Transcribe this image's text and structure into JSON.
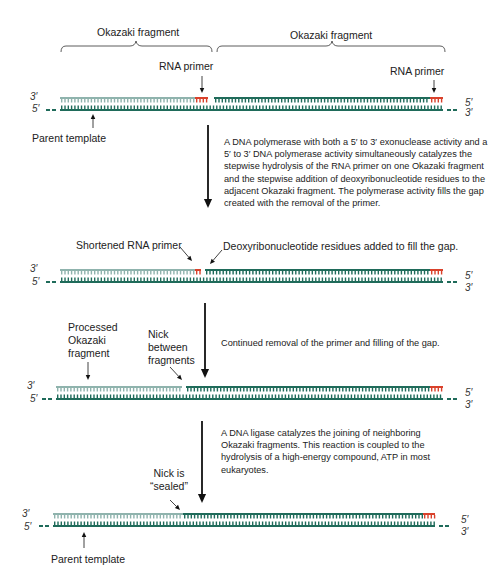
{
  "colors": {
    "new_dna": "#1f6b5a",
    "old_fragment": "#8fb3ad",
    "rna_primer": "#d9412b",
    "template": "#1f6b5a",
    "arrow": "#111111"
  },
  "step1": {
    "fragment_left_label": "Okazaki fragment",
    "fragment_right_label": "Okazaki fragment",
    "primer_left_label": "RNA primer",
    "primer_right_label": "RNA primer",
    "parent_template_label": "Parent template",
    "end_top_left": "3′",
    "end_bottom_left": "5′",
    "end_top_right": "5′",
    "end_bottom_right": "3′"
  },
  "arrow1_text": "A DNA polymerase with both a 5′ to 3′ exonuclease activity and a 5′ to 3′ DNA polymerase activity simultaneously catalyzes the stepwise hydrolysis of the RNA primer on one Okazaki fragment and the stepwise addition of deoxyribonucleotide residues to the adjacent Okazaki fragment. The polymerase activity fills the gap created with the removal of the primer.",
  "step2": {
    "shortened_primer_label": "Shortened RNA primer",
    "residues_added_label": "Deoxyribonucleotide residues added to fill the gap.",
    "end_top_left": "3′",
    "end_bottom_left": "5′",
    "end_top_right": "5′",
    "end_bottom_right": "3′"
  },
  "arrow2_text": "Continued removal of the primer and filling of the gap.",
  "step3": {
    "processed_label": [
      "Processed",
      "Okazaki",
      "fragment"
    ],
    "nick_label": [
      "Nick",
      "between",
      "fragments"
    ],
    "end_top_left": "3′",
    "end_bottom_left": "5′",
    "end_top_right": "5′",
    "end_bottom_right": "3′"
  },
  "arrow3_text": "A DNA ligase catalyzes the joining of neighboring Okazaki fragments. This reaction is coupled to the hydrolysis of a high-energy compound, ATP in most eukaryotes.",
  "step4": {
    "sealed_label": [
      "Nick is",
      "“sealed”"
    ],
    "parent_template_label": "Parent template",
    "end_top_left": "3′",
    "end_bottom_left": "5′",
    "end_top_right": "5′",
    "end_bottom_right": "3′"
  },
  "strands": [
    {
      "y": 97,
      "segments": [
        {
          "x1": 60,
          "x2": 195,
          "c": "old"
        },
        {
          "x1": 195,
          "x2": 208,
          "c": "rna"
        },
        {
          "x1": 214,
          "x2": 430,
          "c": "new"
        },
        {
          "x1": 430,
          "x2": 443,
          "c": "rna"
        }
      ]
    },
    {
      "y": 269,
      "segments": [
        {
          "x1": 60,
          "x2": 195,
          "c": "old"
        },
        {
          "x1": 195,
          "x2": 201,
          "c": "rna"
        },
        {
          "x1": 205,
          "x2": 430,
          "c": "new"
        },
        {
          "x1": 430,
          "x2": 443,
          "c": "rna"
        }
      ]
    },
    {
      "y": 386,
      "segments": [
        {
          "x1": 56,
          "x2": 182,
          "c": "old"
        },
        {
          "x1": 186,
          "x2": 430,
          "c": "new"
        },
        {
          "x1": 430,
          "x2": 443,
          "c": "rna"
        }
      ]
    },
    {
      "y": 513,
      "segments": [
        {
          "x1": 53,
          "x2": 183,
          "c": "old"
        },
        {
          "x1": 183,
          "x2": 423,
          "c": "new"
        },
        {
          "x1": 423,
          "x2": 435,
          "c": "rna"
        }
      ]
    }
  ],
  "templates": [
    {
      "y": 109,
      "x1": 60,
      "x2": 443
    },
    {
      "y": 281,
      "x1": 60,
      "x2": 443
    },
    {
      "y": 398,
      "x1": 56,
      "x2": 443
    },
    {
      "y": 525,
      "x1": 53,
      "x2": 435
    }
  ]
}
